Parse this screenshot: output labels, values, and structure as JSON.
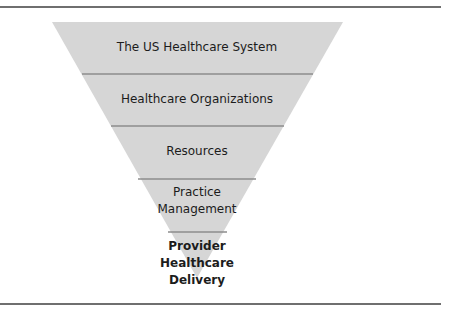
{
  "diagram": {
    "type": "inverted-funnel",
    "colors": {
      "fill": "#d6d6d6",
      "divider": "#8c8c8c",
      "rule": "#6f6f6f",
      "text": "#1c1c1c"
    },
    "levels": [
      {
        "label": "The US Healthcare System",
        "lines": [
          "The US Healthcare System"
        ],
        "bold": false
      },
      {
        "label": "Healthcare Organizations",
        "lines": [
          "Healthcare Organizations"
        ],
        "bold": false
      },
      {
        "label": "Resources",
        "lines": [
          "Resources"
        ],
        "bold": false
      },
      {
        "label": "Practice Management",
        "lines": [
          "Practice",
          "Management"
        ],
        "bold": false
      },
      {
        "label": "Provider Healthcare Delivery",
        "lines": [
          "Provider",
          "Healthcare",
          "Delivery"
        ],
        "bold": true
      }
    ]
  }
}
